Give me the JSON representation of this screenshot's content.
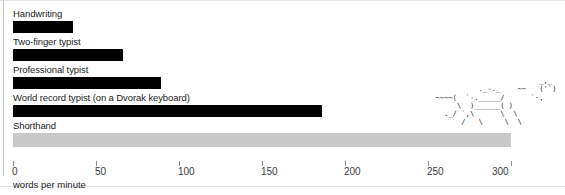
{
  "chart_data": {
    "type": "bar",
    "orientation": "horizontal",
    "title": "",
    "xlabel": "words per minute",
    "ylabel": "",
    "xlim": [
      0,
      300
    ],
    "xticks": [
      0,
      50,
      100,
      150,
      200,
      250,
      300
    ],
    "xticklabels": [
      "0",
      "50",
      "100",
      "150",
      "200",
      "250",
      "300"
    ],
    "grid": false,
    "legend": "none",
    "categories": [
      "Handwriting",
      "Two-finger typist",
      "Professional typist",
      "World record typist (on a Dvorak keyboard)",
      "Shorthand"
    ],
    "values": [
      36,
      66,
      89,
      186,
      300
    ],
    "bar_colors": [
      "#000000",
      "#000000",
      "#000000",
      "#000000",
      "#c8c8c8"
    ],
    "annotations": [
      {
        "name": "ascii-horse",
        "text": "                        _,_\n          ._-._    ~~   ('·)\n ~~~~( `    ______/   `·,\n      \\  )__/   ( )\n  ._/  `,\\___,/  \\\n       /    \\     \\"
      }
    ]
  },
  "chart": {
    "axis_title": "words per minute",
    "rows": [
      {
        "label": "Handwriting",
        "value": 36,
        "muted": false
      },
      {
        "label": "Two-finger typist",
        "value": 66,
        "muted": false
      },
      {
        "label": "Professional typist",
        "value": 89,
        "muted": false
      },
      {
        "label": "World record typist (on a Dvorak keyboard)",
        "value": 186,
        "muted": false
      },
      {
        "label": "Shorthand",
        "value": 300,
        "muted": true
      }
    ],
    "ticks": [
      {
        "value": 0,
        "label": "0"
      },
      {
        "value": 50,
        "label": "50"
      },
      {
        "value": 100,
        "label": "100"
      },
      {
        "value": 150,
        "label": "150"
      },
      {
        "value": 200,
        "label": "200"
      },
      {
        "value": 250,
        "label": "250"
      },
      {
        "value": 300,
        "label": "300"
      }
    ],
    "colors": {
      "bar": "#000000",
      "bar_muted": "#c8c8c8",
      "text": "#1b1b1b",
      "tick": "#8a8a8a",
      "background": "#ffffff"
    }
  },
  "decoration": {
    "ascii_art_lines": [
      "                            _,_",
      "              ._-._    ~~   ('`)",
      "    ~~~~(  `-._____/      `·,",
      "         \\  )______( )",
      "      ._/ `,\\      \\  \\",
      "          /   \\     \\  \\"
    ]
  }
}
